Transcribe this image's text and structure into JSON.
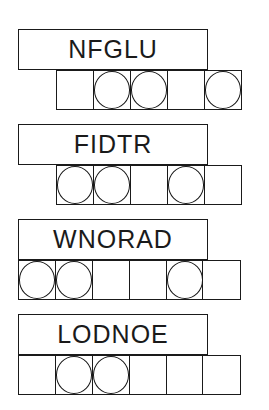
{
  "puzzles": [
    {
      "scrambled": "NFGLU",
      "length": 5,
      "circled": [
        2,
        3,
        5
      ],
      "cells_left": 56,
      "top": 29
    },
    {
      "scrambled": "FIDTR",
      "length": 5,
      "circled": [
        1,
        2,
        4
      ],
      "cells_left": 56,
      "top": 124
    },
    {
      "scrambled": "WNORAD",
      "length": 6,
      "circled": [
        1,
        2,
        5
      ],
      "cells_left": 18,
      "top": 219
    },
    {
      "scrambled": "LODNOE",
      "length": 6,
      "circled": [
        2,
        3
      ],
      "cells_left": 18,
      "top": 314
    }
  ],
  "colors": {
    "line": "#1a1a1a",
    "background": "#ffffff"
  }
}
